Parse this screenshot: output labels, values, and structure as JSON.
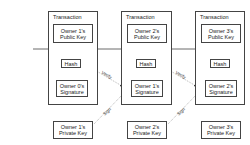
{
  "diagram": {
    "transactions": [
      {
        "title": "Transaction",
        "public_key": "Owner 1's\nPublic Key",
        "hash": "Hash",
        "signature": "Owner 0's\nSignature"
      },
      {
        "title": "Transaction",
        "public_key": "Owner 2's\nPublic Key",
        "hash": "Hash",
        "signature": "Owner 1's\nSignature"
      },
      {
        "title": "Transaction",
        "public_key": "Owner 3's\nPublic Key",
        "hash": "Hash",
        "signature": "Owner 2's\nSignature"
      }
    ],
    "private_keys": [
      "Owner 1's\nPrivate Key",
      "Owner 2's\nPrivate Key",
      "Owner 3's\nPrivate Key"
    ],
    "edge_labels": {
      "verify": "Verify",
      "sign": "Sign"
    },
    "colors": {
      "line": "#444444",
      "dotted": "#888888",
      "background": "#ffffff"
    }
  }
}
